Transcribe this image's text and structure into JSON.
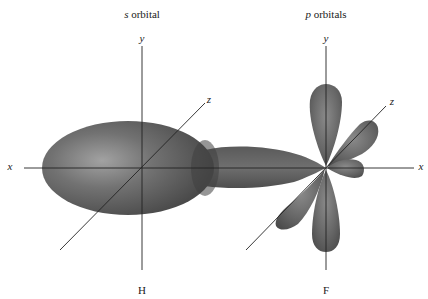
{
  "diagram": {
    "title_left_prefix": "s",
    "title_left_suffix": " orbital",
    "title_right_prefix": "p",
    "title_right_suffix": " orbitals",
    "left_axes": {
      "x": "x",
      "y": "y",
      "z": "z"
    },
    "right_axes": {
      "x": "x",
      "y": "y",
      "z": "z"
    },
    "left_atom": "H",
    "right_atom": "F",
    "colors": {
      "orbital_dark": "#4a4a4a",
      "orbital_mid": "#6e6e6e",
      "orbital_light": "#9a9a9a",
      "axis": "#222222",
      "background": "#ffffff"
    }
  }
}
